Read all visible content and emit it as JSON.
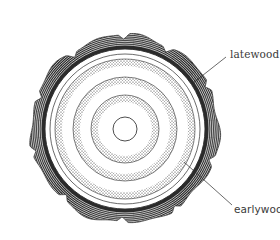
{
  "diagram": {
    "labels": {
      "latewood": "latewood",
      "earlywood": "earlywooe"
    },
    "colors": {
      "ink": "#2b2b2b",
      "background": "#ffffff",
      "label_text": "#3a3a3a"
    },
    "geometry": {
      "center": [
        125,
        129
      ],
      "bark_outer_radius": 96,
      "bark_inner_radius": 83,
      "cambium_radius": 80,
      "latewood_bands": [
        {
          "outer": 70,
          "inner": 63
        },
        {
          "outer": 52,
          "inner": 45
        },
        {
          "outer": 34,
          "inner": 27
        }
      ],
      "pith_radius": 12
    }
  }
}
